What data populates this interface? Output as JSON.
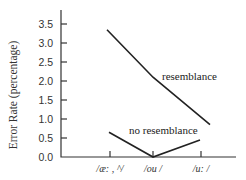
{
  "chart_data": {
    "type": "line",
    "title": "",
    "xlabel": "",
    "ylabel": "Error  Rate  (percentage)",
    "categories": [
      "/æ: , ^/",
      "/ou /",
      "/u: /"
    ],
    "series": [
      {
        "name": "resemblance",
        "values": [
          3.35,
          2.1,
          0.85
        ]
      },
      {
        "name": "no resemblance",
        "values": [
          0.65,
          0.0,
          0.45
        ]
      }
    ],
    "ylim": [
      0,
      3.8
    ],
    "yticks": [
      0.0,
      0.5,
      1.0,
      1.5,
      2.0,
      2.5,
      3.0,
      3.5
    ],
    "ytick_labels": [
      "0.0",
      "0.5",
      "1.0",
      "1.5",
      "2.0",
      "2.5",
      "3.0",
      "3.5"
    ],
    "grid": false,
    "legend": "inline labels near lines"
  }
}
